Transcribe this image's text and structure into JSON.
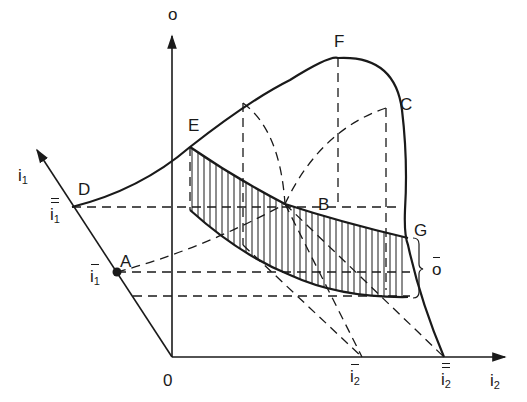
{
  "diagram": {
    "axes": {
      "vertical": "o",
      "left_oblique": "i",
      "left_oblique_sub": "1",
      "horizontal": "i",
      "horizontal_sub": "2",
      "origin": "0"
    },
    "points": {
      "A": "A",
      "B": "B",
      "C": "C",
      "D": "D",
      "E": "E",
      "F": "F",
      "G": "G"
    },
    "tick_labels": {
      "i1_bar": "i",
      "i1_bar_sub": "1",
      "i1_doublebar": "i",
      "i1_doublebar_sub": "1",
      "i2_bar": "i",
      "i2_bar_sub": "2",
      "i2_doublebar": "i",
      "i2_doublebar_sub": "2",
      "o_bar": "o"
    },
    "colors": {
      "ink": "#1a1a1a",
      "background": "#ffffff"
    }
  }
}
